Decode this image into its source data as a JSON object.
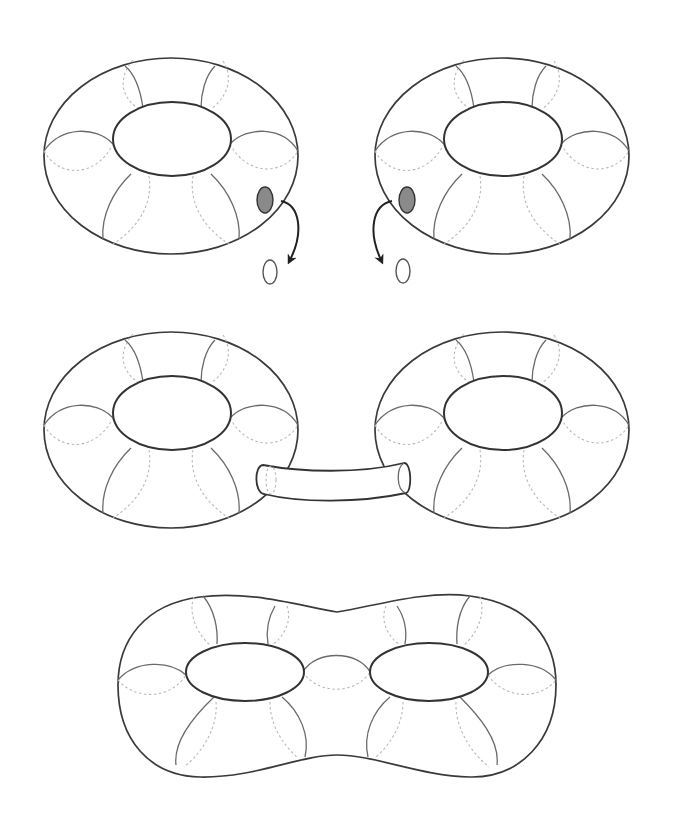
{
  "figure": {
    "title": "Connected sum of two tori forming a genus-2 surface",
    "steps": [
      {
        "id": "step-1",
        "label": "Two tori with a disk removed from each"
      },
      {
        "id": "step-2",
        "label": "Tori joined by a connecting tube"
      },
      {
        "id": "step-3",
        "label": "Resulting double torus (genus 2)"
      }
    ],
    "colors": {
      "outline": "#3a3a3a",
      "removed_disk_fill": "#8a8a8a",
      "hidden_line": "#b8b8b8",
      "background": "#ffffff"
    }
  }
}
